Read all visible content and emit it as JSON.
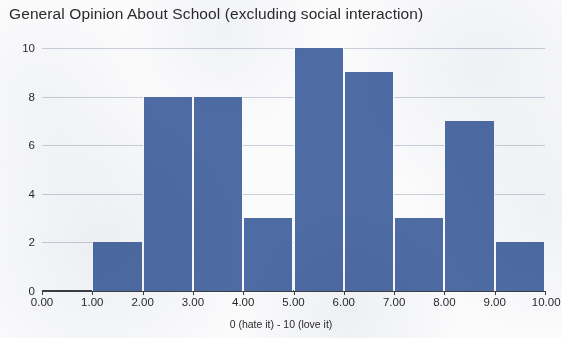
{
  "chart_data": {
    "type": "bar",
    "title": "General Opinion About School (excluding social interaction)",
    "subtitle": "",
    "xlabel": "0 (hate it) - 10 (love it)",
    "ylabel": "",
    "categories": [
      "0-1",
      "1-2",
      "2-3",
      "3-4",
      "4-5",
      "5-6",
      "6-7",
      "7-8",
      "8-9",
      "9-10"
    ],
    "values": [
      0,
      2,
      8,
      8,
      3,
      10,
      9,
      3,
      7,
      2
    ],
    "bin_edges": [
      0,
      1,
      2,
      3,
      4,
      5,
      6,
      7,
      8,
      9,
      10
    ],
    "x_tick_labels": [
      "0.00",
      "1.00",
      "2.00",
      "3.00",
      "4.00",
      "5.00",
      "6.00",
      "7.00",
      "8.00",
      "9.00",
      "10.00"
    ],
    "x_tick_values": [
      0,
      1,
      2,
      3,
      4,
      5,
      6,
      7,
      8,
      9,
      10
    ],
    "y_tick_labels": [
      "0",
      "2",
      "4",
      "6",
      "8",
      "10"
    ],
    "y_tick_values": [
      0,
      2,
      4,
      6,
      8,
      10
    ],
    "xlim": [
      0,
      10
    ],
    "ylim": [
      0,
      10
    ],
    "grid": true,
    "grid_axis": "y",
    "legend": false,
    "bar_color": "#4e6ca4",
    "gridline_color": "#c9cfd8",
    "axis_color": "#3c3f44",
    "background_color": "#fbfbfc",
    "text_color": "#2b2b2e"
  }
}
